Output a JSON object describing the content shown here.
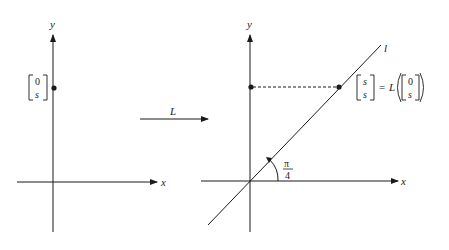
{
  "figure": {
    "transform_label": "L",
    "left_plot": {
      "x_axis_label": "x",
      "y_axis_label": "y",
      "point_vector": {
        "top": "0",
        "bottom": "s"
      }
    },
    "right_plot": {
      "x_axis_label": "x",
      "y_axis_label": "y",
      "line_label": "l",
      "angle_label": {
        "numerator": "π",
        "denominator": "4"
      },
      "image_vector": {
        "top": "s",
        "bottom": "s"
      },
      "equals": "=",
      "map_name": "L",
      "preimage_vector": {
        "top": "0",
        "bottom": "s"
      }
    },
    "colors": {
      "ink": "#1a1a1a",
      "background": "#ffffff"
    }
  }
}
